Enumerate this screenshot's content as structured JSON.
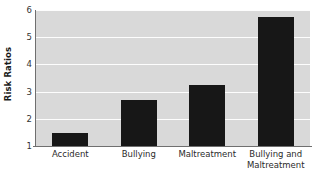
{
  "chart_data": {
    "type": "bar",
    "title": "",
    "subtitle": "",
    "xlabel": "",
    "ylabel": "Risk Ratios",
    "categories": [
      "Accident",
      "Bullying",
      "Maltreatment",
      "Bullying and\nMaltreatment"
    ],
    "values": [
      1.48,
      2.68,
      3.25,
      5.73
    ],
    "series": [
      {
        "name": "Risk Ratios",
        "values": [
          1.48,
          2.68,
          3.25,
          5.73
        ]
      }
    ],
    "ylim": [
      1,
      6
    ],
    "yticks": [
      1,
      2,
      3,
      4,
      5,
      6
    ],
    "ytick_labels": [
      "1",
      "2",
      "3",
      "4",
      "5",
      "6"
    ],
    "xtick_labels": [
      "Accident",
      "Bullying",
      "Maltreatment",
      "Bullying and\nMaltreatment"
    ],
    "grid": true,
    "grid_axis": "y",
    "legend": false,
    "legend_position": "none",
    "annotations": [],
    "colors": {
      "bar": "#171717",
      "plot_background": "#d9d9d9",
      "gridline": "#fdfdfd",
      "axis_line": "#6f6f6f",
      "figure_background": "#ffffff",
      "tick_label": "#333333",
      "axis_title": "#1a1a1a"
    }
  }
}
